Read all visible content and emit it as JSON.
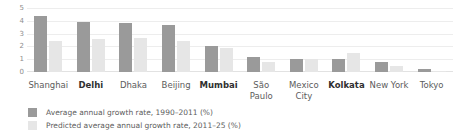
{
  "chart_data": {
    "type": "bar",
    "title": "",
    "xlabel": "",
    "ylabel": "",
    "ylim": [
      0,
      5
    ],
    "yticks": [
      "5",
      "4",
      "3",
      "2",
      "1",
      "0"
    ],
    "grid": true,
    "legend_position": "bottom-left",
    "categories": [
      "Shanghai",
      "Delhi",
      "Dhaka",
      "Beijing",
      "Mumbai",
      "São Paulo",
      "Mexico City",
      "Kolkata",
      "New York",
      "Tokyo"
    ],
    "highlighted_categories": [
      "Delhi",
      "Mumbai",
      "Kolkata"
    ],
    "series": [
      {
        "name": "Average annual growth rate, 1990–2011 (%)",
        "color": "#9a9a9a",
        "values": [
          4.4,
          3.9,
          3.85,
          3.7,
          2.0,
          1.15,
          1.05,
          1.0,
          0.75,
          0.2
        ]
      },
      {
        "name": "Predicted average annual growth rate, 2011–25 (%)",
        "color": "#e6e6e6",
        "values": [
          2.4,
          2.6,
          2.65,
          2.45,
          1.9,
          0.8,
          1.0,
          1.5,
          0.5,
          0.05
        ]
      }
    ]
  },
  "legend": {
    "items": [
      {
        "label": "Average annual growth rate, 1990–2011 (%)",
        "swatch": "actual"
      },
      {
        "label": "Predicted average annual growth rate, 2011–25 (%)",
        "swatch": "predicted"
      }
    ]
  }
}
